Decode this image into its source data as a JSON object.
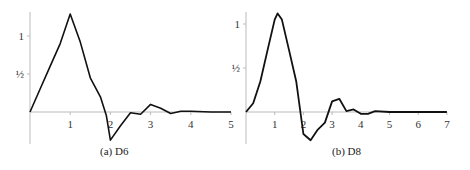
{
  "chart_data": [
    {
      "type": "line",
      "title": "",
      "caption": "(a)  D6",
      "xlabel": "",
      "ylabel": "",
      "xlim": [
        0,
        5
      ],
      "ylim": [
        -0.4,
        1.35
      ],
      "x_ticks": [
        "1",
        "2",
        "3",
        "4",
        "5"
      ],
      "y_ticks": [
        "1",
        "½"
      ],
      "grid": false,
      "series": [
        {
          "name": "D6 scaling function",
          "x": [
            0,
            0.25,
            0.5,
            0.75,
            1.0,
            1.25,
            1.5,
            1.75,
            1.9,
            2.0,
            2.25,
            2.5,
            2.75,
            3.0,
            3.25,
            3.5,
            3.75,
            4.0,
            4.5,
            5.0
          ],
          "y": [
            0,
            0.3,
            0.6,
            0.9,
            1.29,
            0.92,
            0.45,
            0.2,
            -0.05,
            -0.37,
            -0.18,
            -0.01,
            -0.03,
            0.1,
            0.05,
            -0.02,
            0.01,
            0.01,
            0.0,
            0.0
          ]
        }
      ]
    },
    {
      "type": "line",
      "title": "",
      "caption": "(b)  D8",
      "xlabel": "",
      "ylabel": "",
      "xlim": [
        0,
        7
      ],
      "ylim": [
        -0.4,
        1.15
      ],
      "x_ticks": [
        "1",
        "2",
        "3",
        "4",
        "5",
        "6",
        "7"
      ],
      "y_ticks": [
        "1",
        "½"
      ],
      "grid": false,
      "series": [
        {
          "name": "D8 scaling function",
          "x": [
            0,
            0.25,
            0.5,
            0.75,
            1.0,
            1.1,
            1.25,
            1.5,
            1.75,
            2.0,
            2.25,
            2.5,
            2.75,
            3.0,
            3.25,
            3.5,
            3.75,
            4.0,
            4.25,
            4.5,
            5.0,
            6.0,
            7.0
          ],
          "y": [
            0,
            0.1,
            0.35,
            0.7,
            1.05,
            1.12,
            1.05,
            0.7,
            0.35,
            -0.25,
            -0.32,
            -0.2,
            -0.12,
            0.12,
            0.15,
            0.01,
            0.03,
            -0.02,
            -0.02,
            0.01,
            0.0,
            0.0,
            0.0
          ]
        }
      ]
    }
  ]
}
